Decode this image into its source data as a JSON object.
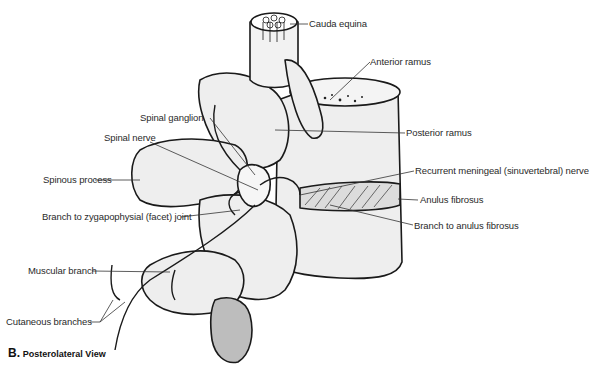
{
  "figure": {
    "view_letter": "B.",
    "view_title": "Posterolateral View"
  },
  "labels": {
    "cauda_equina": "Cauda equina",
    "anterior_ramus": "Anterior ramus",
    "posterior_ramus": "Posterior ramus",
    "recurrent_meningeal": "Recurrent meningeal (sinuvertebral) nerve",
    "anulus_fibrosus": "Anulus fibrosus",
    "branch_to_anulus": "Branch to anulus fibrosus",
    "spinal_ganglion": "Spinal ganglion",
    "spinal_nerve": "Spinal nerve",
    "spinous_process": "Spinous process",
    "branch_to_facet": "Branch to zygapophysial (facet) joint",
    "muscular_branch": "Muscular branch",
    "cutaneous_branches": "Cutaneous branches"
  },
  "colors": {
    "bone_fill": "#eeeeee",
    "bone_shade": "#cfcfcf",
    "outline": "#1a1a1a",
    "leader": "#333333"
  }
}
